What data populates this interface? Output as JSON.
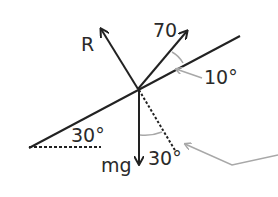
{
  "diagram": {
    "type": "force-diagram-inclined-plane",
    "labels": {
      "normal_force": "R",
      "applied_force": "70",
      "weight": "mg",
      "incline_angle": "30°",
      "applied_angle": "10°",
      "weight_angle": "30°"
    },
    "colors": {
      "line": "#222222",
      "annotation": "#a8a8a8",
      "text": "#2a2a2a"
    }
  }
}
